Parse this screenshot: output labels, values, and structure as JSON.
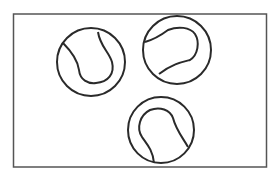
{
  "scene": {
    "description": "Three tennis balls inside a rectangular frame",
    "frame_color": "#555555",
    "stroke_color": "#2a2a2a",
    "background": "#ffffff",
    "ball_count": 3
  }
}
